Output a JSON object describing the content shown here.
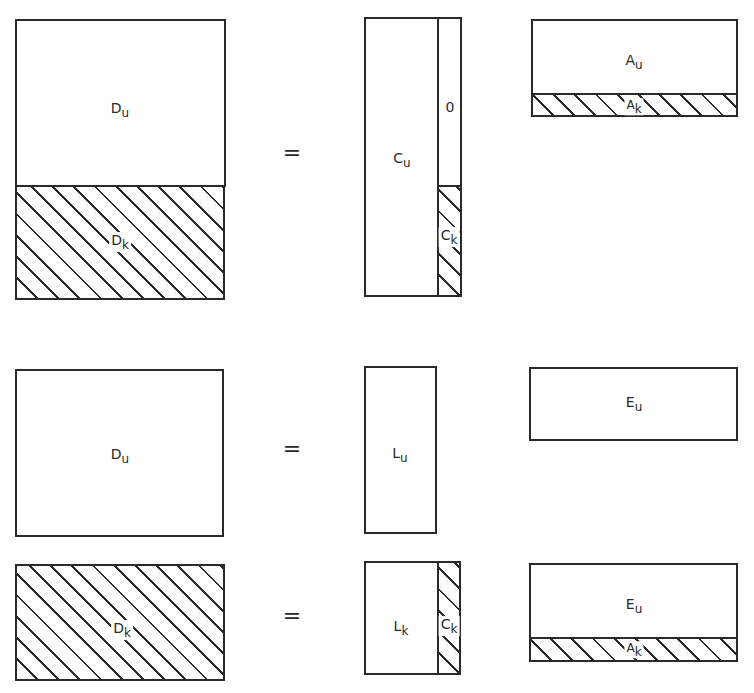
{
  "figure": {
    "equations": [
      {
        "name": "row1",
        "lhs": {
          "top": {
            "main": "D",
            "sub": "u"
          },
          "bottom": {
            "main": "D",
            "sub": "k"
          }
        },
        "equals": "=",
        "middle": {
          "left": {
            "main": "C",
            "sub": "u"
          },
          "right_top": {
            "main": "0",
            "sub": ""
          },
          "right_bottom": {
            "main": "C",
            "sub": "k"
          }
        },
        "right": {
          "top": {
            "main": "A",
            "sub": "u"
          },
          "bottom": {
            "main": "A",
            "sub": "k"
          }
        }
      },
      {
        "name": "row2",
        "lhs": {
          "main": "D",
          "sub": "u"
        },
        "equals": "=",
        "middle": {
          "main": "L",
          "sub": "u"
        },
        "right": {
          "main": "E",
          "sub": "u"
        }
      },
      {
        "name": "row3",
        "lhs": {
          "main": "D",
          "sub": "k"
        },
        "equals": "=",
        "middle": {
          "left": {
            "main": "L",
            "sub": "k"
          },
          "right": {
            "main": "C",
            "sub": "k"
          }
        },
        "right": {
          "top": {
            "main": "E",
            "sub": "u"
          },
          "bottom": {
            "main": "A",
            "sub": "k"
          }
        }
      }
    ],
    "legend": {
      "hatched": "known part",
      "plain": "unknown part"
    }
  }
}
